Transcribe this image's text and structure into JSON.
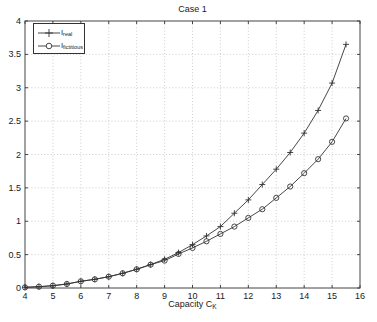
{
  "figure": {
    "title": "Case 1"
  },
  "xlabel": {
    "base": "Capacity C",
    "sub": "K"
  },
  "legend": {
    "position": "top-left",
    "items": [
      {
        "base": "I",
        "sub": "real",
        "marker": "plus-line"
      },
      {
        "base": "I",
        "sub": "fictitious",
        "marker": "circle-line"
      }
    ]
  },
  "colors": {
    "line": "#333333",
    "grid": "#c0c0c0",
    "text": "#1a1a1a",
    "axis": "#444444",
    "background": "#ffffff"
  },
  "chart_data": {
    "type": "line",
    "title": "Case 1",
    "xlabel": "Capacity C_K",
    "ylabel": "",
    "xlim": [
      4,
      16
    ],
    "ylim": [
      0,
      4
    ],
    "x_ticks": [
      4,
      5,
      6,
      7,
      8,
      9,
      10,
      11,
      12,
      13,
      14,
      15,
      16
    ],
    "y_ticks": [
      0,
      0.5,
      1,
      1.5,
      2,
      2.5,
      3,
      3.5,
      4
    ],
    "grid": true,
    "legend_position": "top-left",
    "x": [
      4,
      4.5,
      5,
      5.5,
      6,
      6.5,
      7,
      7.5,
      8,
      8.5,
      9,
      9.5,
      10,
      10.5,
      11,
      11.5,
      12,
      12.5,
      13,
      13.5,
      14,
      14.5,
      15,
      15.5
    ],
    "series": [
      {
        "name": "I_real",
        "marker": "plus",
        "values": [
          0.01,
          0.02,
          0.035,
          0.06,
          0.1,
          0.13,
          0.17,
          0.22,
          0.28,
          0.35,
          0.43,
          0.53,
          0.65,
          0.78,
          0.92,
          1.12,
          1.32,
          1.55,
          1.78,
          2.03,
          2.32,
          2.66,
          3.07,
          3.65
        ]
      },
      {
        "name": "I_fictitious",
        "marker": "circle",
        "values": [
          0.01,
          0.02,
          0.035,
          0.06,
          0.1,
          0.13,
          0.17,
          0.22,
          0.28,
          0.35,
          0.41,
          0.51,
          0.6,
          0.7,
          0.81,
          0.92,
          1.05,
          1.18,
          1.35,
          1.52,
          1.72,
          1.93,
          2.19,
          2.54
        ]
      }
    ]
  }
}
